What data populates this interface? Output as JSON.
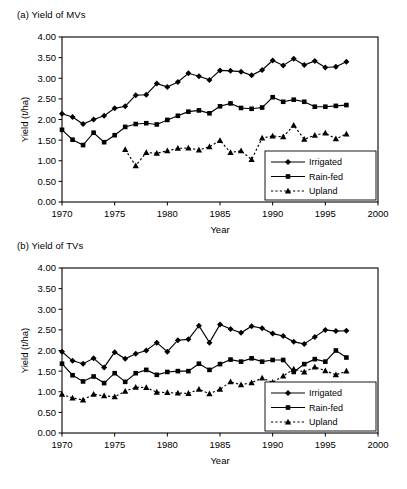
{
  "figure": {
    "panels": [
      {
        "id": "a",
        "title": "(a) Yield of MVs",
        "chart_data": {
          "type": "line",
          "title": "(a) Yield of MVs",
          "xlabel": "Year",
          "ylabel": "Yield (t/ha)",
          "xlim": [
            1970,
            2000
          ],
          "ylim": [
            0.0,
            4.0
          ],
          "xticks": [
            "1970",
            "1975",
            "1980",
            "1985",
            "1990",
            "1995",
            "2000"
          ],
          "yticks": [
            "0.00",
            "0.50",
            "1.00",
            "1.50",
            "2.00",
            "2.50",
            "3.00",
            "3.50",
            "4.00"
          ],
          "grid": false,
          "legend_position": "bottom-right",
          "series": [
            {
              "name": "Irrigated",
              "marker": "diamond",
              "line": "solid",
              "x": [
                1970,
                1971,
                1972,
                1973,
                1974,
                1975,
                1976,
                1977,
                1978,
                1979,
                1980,
                1981,
                1982,
                1983,
                1984,
                1985,
                1986,
                1987,
                1988,
                1989,
                1990,
                1991,
                1992,
                1993,
                1994,
                1995,
                1996,
                1997
              ],
              "values": [
                2.14,
                2.06,
                1.89,
                2.0,
                2.09,
                2.27,
                2.32,
                2.59,
                2.6,
                2.87,
                2.79,
                2.91,
                3.12,
                3.05,
                2.96,
                3.19,
                3.18,
                3.16,
                3.07,
                3.2,
                3.43,
                3.31,
                3.47,
                3.32,
                3.42,
                3.26,
                3.28,
                3.4
              ]
            },
            {
              "name": "Rain-fed",
              "marker": "square",
              "line": "solid",
              "x": [
                1970,
                1971,
                1972,
                1973,
                1974,
                1975,
                1976,
                1977,
                1978,
                1979,
                1980,
                1981,
                1982,
                1983,
                1984,
                1985,
                1986,
                1987,
                1988,
                1989,
                1990,
                1991,
                1992,
                1993,
                1994,
                1995,
                1996,
                1997
              ],
              "values": [
                1.75,
                1.51,
                1.38,
                1.68,
                1.45,
                1.62,
                1.82,
                1.89,
                1.91,
                1.88,
                1.99,
                2.09,
                2.19,
                2.22,
                2.15,
                2.32,
                2.39,
                2.28,
                2.26,
                2.29,
                2.54,
                2.43,
                2.48,
                2.43,
                2.31,
                2.31,
                2.33,
                2.35
              ]
            },
            {
              "name": "Upland",
              "marker": "triangle",
              "line": "dashed",
              "x": [
                1976,
                1977,
                1978,
                1979,
                1980,
                1981,
                1982,
                1983,
                1984,
                1985,
                1986,
                1987,
                1988,
                1989,
                1990,
                1991,
                1992,
                1993,
                1994,
                1995,
                1996,
                1997
              ],
              "values": [
                1.27,
                0.88,
                1.2,
                1.18,
                1.24,
                1.3,
                1.31,
                1.26,
                1.34,
                1.49,
                1.2,
                1.24,
                1.03,
                1.55,
                1.6,
                1.58,
                1.86,
                1.52,
                1.62,
                1.67,
                1.53,
                1.65
              ]
            }
          ]
        }
      },
      {
        "id": "b",
        "title": "(b) Yield of TVs",
        "chart_data": {
          "type": "line",
          "title": "(b) Yield of TVs",
          "xlabel": "Year",
          "ylabel": "Yield (t/ha)",
          "xlim": [
            1970,
            2000
          ],
          "ylim": [
            0.0,
            4.0
          ],
          "xticks": [
            "1970",
            "1975",
            "1980",
            "1985",
            "1990",
            "1995",
            "2000"
          ],
          "yticks": [
            "0.00",
            "0.50",
            "1.00",
            "1.50",
            "2.00",
            "2.50",
            "3.00",
            "3.50",
            "4.00"
          ],
          "grid": false,
          "legend_position": "bottom-right",
          "series": [
            {
              "name": "Irrigated",
              "marker": "diamond",
              "line": "solid",
              "x": [
                1970,
                1971,
                1972,
                1973,
                1974,
                1975,
                1976,
                1977,
                1978,
                1979,
                1980,
                1981,
                1982,
                1983,
                1984,
                1985,
                1986,
                1987,
                1988,
                1989,
                1990,
                1991,
                1992,
                1993,
                1994,
                1995,
                1996,
                1997
              ],
              "values": [
                1.97,
                1.75,
                1.68,
                1.81,
                1.59,
                1.96,
                1.8,
                1.92,
                2.0,
                2.19,
                1.97,
                2.25,
                2.27,
                2.6,
                2.19,
                2.63,
                2.52,
                2.43,
                2.59,
                2.54,
                2.41,
                2.35,
                2.21,
                2.16,
                2.33,
                2.5,
                2.47,
                2.48
              ]
            },
            {
              "name": "Rain-fed",
              "marker": "square",
              "line": "solid",
              "x": [
                1970,
                1971,
                1972,
                1973,
                1974,
                1975,
                1976,
                1977,
                1978,
                1979,
                1980,
                1981,
                1982,
                1983,
                1984,
                1985,
                1986,
                1987,
                1988,
                1989,
                1990,
                1991,
                1992,
                1993,
                1994,
                1995,
                1996,
                1997
              ],
              "values": [
                1.68,
                1.4,
                1.25,
                1.37,
                1.21,
                1.45,
                1.24,
                1.45,
                1.53,
                1.41,
                1.48,
                1.5,
                1.5,
                1.68,
                1.53,
                1.67,
                1.78,
                1.73,
                1.81,
                1.73,
                1.77,
                1.77,
                1.48,
                1.67,
                1.79,
                1.73,
                2.0,
                1.83
              ]
            },
            {
              "name": "Upland",
              "marker": "triangle",
              "line": "dashed",
              "x": [
                1970,
                1971,
                1972,
                1973,
                1974,
                1975,
                1976,
                1977,
                1978,
                1979,
                1980,
                1981,
                1982,
                1983,
                1984,
                1985,
                1986,
                1987,
                1988,
                1989,
                1990,
                1991,
                1992,
                1993,
                1994,
                1995,
                1996,
                1997
              ],
              "values": [
                0.94,
                0.85,
                0.8,
                0.94,
                0.9,
                0.88,
                1.01,
                1.11,
                1.1,
                0.99,
                0.98,
                0.97,
                0.96,
                1.06,
                0.95,
                1.06,
                1.24,
                1.17,
                1.22,
                1.33,
                1.23,
                1.38,
                1.55,
                1.48,
                1.6,
                1.51,
                1.41,
                1.5
              ]
            }
          ]
        }
      }
    ]
  }
}
